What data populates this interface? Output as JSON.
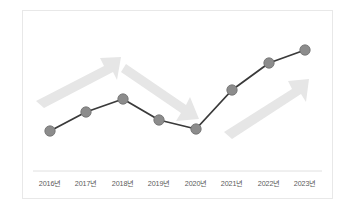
{
  "chart_data": {
    "type": "line",
    "title": "",
    "subtitle": "",
    "xlabel": "",
    "ylabel": "",
    "grid": false,
    "legend": null,
    "categories": [
      "2016년",
      "2017년",
      "2018년",
      "2019년",
      "2020년",
      "2021년",
      "2022년",
      "2023년"
    ],
    "series": [
      {
        "name": "추이",
        "values": [
          21,
          36,
          52,
          38,
          28,
          65,
          86,
          98
        ]
      }
    ],
    "ylim": [
      0,
      110
    ],
    "points": [
      {
        "category": "2016년",
        "value": 21,
        "px": 50,
        "py": 131
      },
      {
        "category": "2017년",
        "value": 36,
        "px": 86,
        "py": 112
      },
      {
        "category": "2018년",
        "value": 52,
        "px": 123,
        "py": 99
      },
      {
        "category": "2019년",
        "value": 38,
        "px": 159,
        "py": 120
      },
      {
        "category": "2020년",
        "value": 28,
        "px": 196,
        "py": 129
      },
      {
        "category": "2021년",
        "value": 65,
        "px": 232,
        "py": 90
      },
      {
        "category": "2022년",
        "value": 86,
        "px": 269,
        "py": 63
      },
      {
        "category": "2023년",
        "value": 98,
        "px": 305,
        "py": 50
      }
    ],
    "annotations": [
      {
        "name": "growth-arrow-1",
        "direction": "up-right",
        "span": [
          "2016년",
          "2018년"
        ],
        "meaning": "increase"
      },
      {
        "name": "decline-arrow",
        "direction": "down-right",
        "span": [
          "2018년",
          "2020년"
        ],
        "meaning": "decrease"
      },
      {
        "name": "growth-arrow-2",
        "direction": "up-right",
        "span": [
          "2021년",
          "2023년"
        ],
        "meaning": "increase"
      }
    ],
    "colors": {
      "line": "#3a3a3a",
      "marker_fill": "#8c8c8c",
      "marker_stroke": "#6e6e6e",
      "arrow": "#e6e6e6",
      "axis": "#e0e0e0",
      "label": "#5b5b5b",
      "card_border": "#e8e8e8",
      "background": "#ffffff"
    },
    "axis_line": {
      "x1": 33,
      "x2": 322,
      "y": 171
    }
  }
}
